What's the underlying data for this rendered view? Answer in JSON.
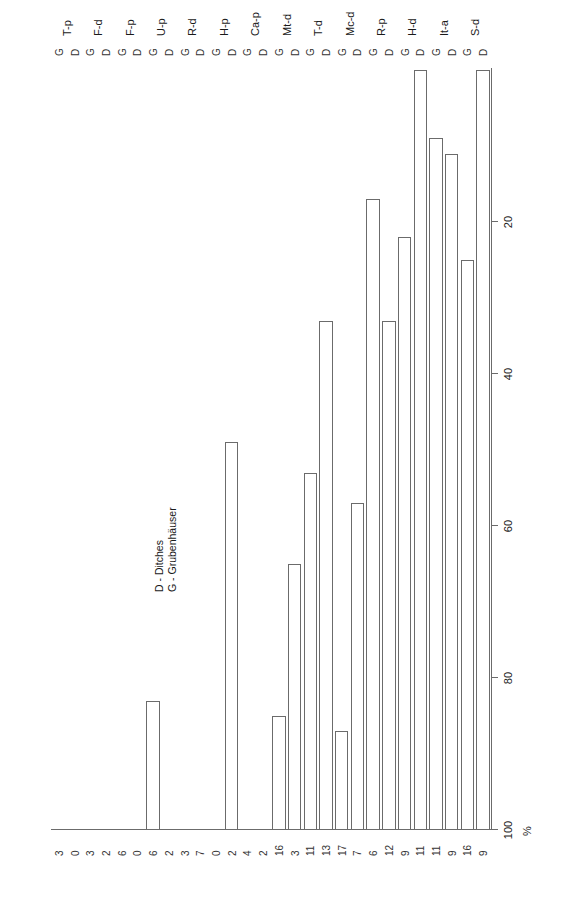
{
  "chart_data": {
    "type": "bar",
    "title": "",
    "subtitle": "",
    "orientation": "horizontal",
    "xlabel": "%",
    "ylabel": "",
    "xlim": [
      0,
      100
    ],
    "xticks": [
      100,
      80,
      60,
      40,
      20
    ],
    "grid": false,
    "legend_position": "plot-interior-upper",
    "categories": [
      "S-d",
      "It-a",
      "H-d",
      "R-p",
      "Mc-d",
      "T-d",
      "Mt-d",
      "Ca-p",
      "H-p",
      "R-d",
      "U-p",
      "F-p",
      "F-d",
      "T-p"
    ],
    "series": [
      {
        "name": "D",
        "legend_label": "D - Ditches",
        "values": [
          100,
          89,
          91,
          78,
          43,
          67,
          35,
          0,
          51,
          0,
          0,
          0,
          0,
          0
        ],
        "counts": [
          9,
          9,
          11,
          9,
          7,
          13,
          3,
          2,
          2,
          7,
          2,
          0,
          2,
          0
        ]
      },
      {
        "name": "G",
        "legend_label": "G - Grubenhäuser",
        "values": [
          75,
          91,
          83,
          67,
          13,
          17,
          15,
          0,
          0,
          0,
          17,
          0,
          0,
          0
        ],
        "counts": [
          16,
          11,
          11,
          12,
          6,
          17,
          11,
          16,
          4,
          0,
          3,
          6,
          0,
          6,
          3,
          3
        ]
      }
    ],
    "count_labels_top_to_bottom": [
      3,
      0,
      3,
      2,
      6,
      0,
      6,
      2,
      3,
      7,
      0,
      2,
      4,
      2,
      16,
      3,
      11,
      13,
      17,
      7,
      6,
      12,
      9,
      11,
      11,
      9,
      16,
      9
    ],
    "bars": [
      {
        "category": "T-p",
        "series": "G",
        "value": 0,
        "count": "3"
      },
      {
        "category": "T-p",
        "series": "D",
        "value": 0,
        "count": "0"
      },
      {
        "category": "F-d",
        "series": "G",
        "value": 0,
        "count": "3"
      },
      {
        "category": "F-d",
        "series": "D",
        "value": 0,
        "count": "2"
      },
      {
        "category": "F-p",
        "series": "G",
        "value": 0,
        "count": "6"
      },
      {
        "category": "F-p",
        "series": "D",
        "value": 0,
        "count": "0"
      },
      {
        "category": "U-p",
        "series": "G",
        "value": 17,
        "count": "6"
      },
      {
        "category": "U-p",
        "series": "D",
        "value": 0,
        "count": "2"
      },
      {
        "category": "R-d",
        "series": "G",
        "value": 0,
        "count": "3"
      },
      {
        "category": "R-d",
        "series": "D",
        "value": 0,
        "count": "7"
      },
      {
        "category": "H-p",
        "series": "G",
        "value": 0,
        "count": "0"
      },
      {
        "category": "H-p",
        "series": "D",
        "value": 51,
        "count": "2"
      },
      {
        "category": "Ca-p",
        "series": "G",
        "value": 0,
        "count": "4"
      },
      {
        "category": "Ca-p",
        "series": "D",
        "value": 0,
        "count": "2"
      },
      {
        "category": "Mt-d",
        "series": "G",
        "value": 15,
        "count": "16"
      },
      {
        "category": "Mt-d",
        "series": "D",
        "value": 35,
        "count": "3"
      },
      {
        "category": "T-d",
        "series": "G",
        "value": 47,
        "count": "11"
      },
      {
        "category": "T-d",
        "series": "D",
        "value": 67,
        "count": "13"
      },
      {
        "category": "Mc-d",
        "series": "G",
        "value": 13,
        "count": "17"
      },
      {
        "category": "Mc-d",
        "series": "D",
        "value": 43,
        "count": "7"
      },
      {
        "category": "R-p",
        "series": "G",
        "value": 83,
        "count": "6"
      },
      {
        "category": "R-p",
        "series": "D",
        "value": 67,
        "count": "12"
      },
      {
        "category": "H-d",
        "series": "G",
        "value": 78,
        "count": "9"
      },
      {
        "category": "H-d",
        "series": "D",
        "value": 100,
        "count": "11"
      },
      {
        "category": "It-a",
        "series": "G",
        "value": 91,
        "count": "11"
      },
      {
        "category": "It-a",
        "series": "D",
        "value": 89,
        "count": "9"
      },
      {
        "category": "S-d",
        "series": "G",
        "value": 75,
        "count": "16"
      },
      {
        "category": "S-d",
        "series": "D",
        "value": 100,
        "count": "9"
      }
    ]
  },
  "axis": {
    "unit_label": "%",
    "tick_labels": [
      "100",
      "80",
      "60",
      "40",
      "20"
    ],
    "tick_values": [
      100,
      80,
      60,
      40,
      20
    ]
  },
  "legend": {
    "line1": "D - Ditches",
    "line2": "G - Grubenhäuser"
  },
  "colors": {
    "bar_outline": "#6b6b6b",
    "bar_fill": "#ffffff",
    "axis": "#6b6b6b",
    "text": "#1a1a1a",
    "background": "#ffffff"
  }
}
